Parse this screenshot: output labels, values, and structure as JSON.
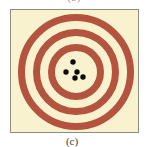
{
  "figure": {
    "caption": "(c)",
    "top_fragment": "(b)",
    "colors": {
      "background": "#f9f2cf",
      "ring": "#b4533e",
      "shot": "#0a0a0a",
      "border": "#8c8c80"
    },
    "target": {
      "center": [
        65,
        62
      ],
      "rings": [
        {
          "name": "outer-ring",
          "radius": 54.5,
          "width": 7
        },
        {
          "name": "middle-ring",
          "radius": 39.5,
          "width": 7
        },
        {
          "name": "inner-ring",
          "radius": 24.5,
          "width": 7
        }
      ]
    },
    "shots": [
      {
        "x": 62,
        "y": 52,
        "r": 2.7
      },
      {
        "x": 55,
        "y": 62,
        "r": 2.7
      },
      {
        "x": 66,
        "y": 62,
        "r": 2.7
      },
      {
        "x": 64,
        "y": 68,
        "r": 2.7
      },
      {
        "x": 72,
        "y": 67,
        "r": 2.7
      }
    ]
  }
}
